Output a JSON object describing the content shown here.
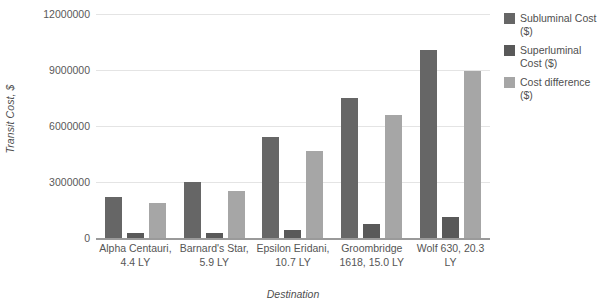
{
  "chart_data": {
    "type": "bar",
    "title": "",
    "subtitle": "",
    "xlabel": "Destination",
    "ylabel": "Transit Cost, $",
    "ylim": [
      0,
      12000000
    ],
    "ytick_labels": [
      "12000000",
      "9000000",
      "6000000",
      "3000000",
      "0"
    ],
    "ytick_values": [
      12000000,
      9000000,
      6000000,
      3000000,
      0
    ],
    "grid": true,
    "legend_position": "right",
    "categories": [
      "Alpha Centauri, 4.4 LY",
      "Barnard's Star, 5.9 LY",
      "Epsilon Eridani, 10.7 LY",
      "Groombridge 1618, 15.0 LY",
      "Wolf 630, 20.3 LY"
    ],
    "series": [
      {
        "name": "Subluminal Cost ($)",
        "color": "#666666",
        "values": [
          2200000,
          2980000,
          5400000,
          7500000,
          10050000
        ]
      },
      {
        "name": "Superluminal Cost ($)",
        "color": "#595959",
        "values": [
          250000,
          280000,
          450000,
          760000,
          1120000
        ]
      },
      {
        "name": "Cost difference ($)",
        "color": "#a6a6a6",
        "values": [
          1850000,
          2500000,
          4650000,
          6600000,
          8930000
        ]
      }
    ]
  },
  "legend": {
    "items": [
      {
        "label": "Subluminal Cost ($)",
        "swatch": "#666666"
      },
      {
        "label": "Superluminal Cost ($)",
        "swatch": "#595959"
      },
      {
        "label": "Cost difference ($)",
        "swatch": "#a6a6a6"
      }
    ]
  }
}
